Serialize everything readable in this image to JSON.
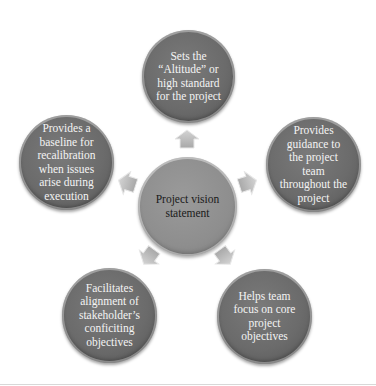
{
  "diagram": {
    "center": {
      "label": "Project vision\nstatement"
    },
    "nodes": [
      {
        "id": "top",
        "label": "Sets the\n“Altitude” or\nhigh standard\nfor the project"
      },
      {
        "id": "right",
        "label": "Provides\nguidance to\nthe project\nteam\nthroughout the\nproject"
      },
      {
        "id": "bottom-right",
        "label": "Helps team\nfocus on core\nproject\nobjectives"
      },
      {
        "id": "bottom-left",
        "label": "Facilitates\nalignment of\nstakeholder’s\nconficiting\nobjectives"
      },
      {
        "id": "left",
        "label": "Provides a\nbaseline for\nrecalibration\nwhen issues\narise during\nexecution"
      }
    ],
    "colors": {
      "satellite": "#6b6b6b",
      "center": "#8e8e8e",
      "arrow": "#b8b8b8",
      "satellite_text": "#f4f4f4",
      "center_text": "#1a1a1a"
    }
  }
}
